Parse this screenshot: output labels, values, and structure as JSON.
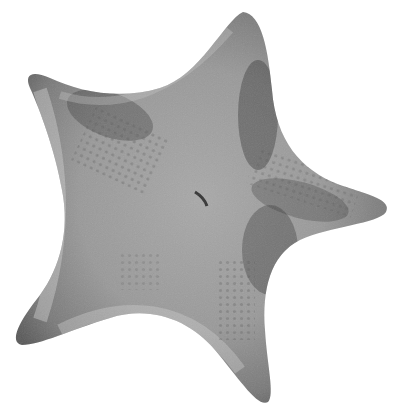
{
  "image": {
    "subject": "starfish illustration",
    "style": "grayscale stippled engraving",
    "colors": {
      "background": "#ffffff",
      "body_light": "#bdbdbd",
      "body_mid": "#8f8f8f",
      "body_dark": "#3a3a3a"
    }
  },
  "caption": {
    "text": "",
    "truncated": true
  }
}
